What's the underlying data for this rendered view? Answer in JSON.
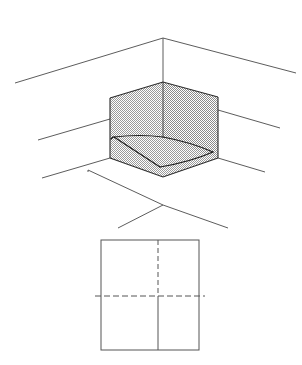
{
  "figure": {
    "background_color": "#ffffff",
    "line_color": "#4a4a4a",
    "edge_color": "#2b2b2b",
    "fill_pattern": "stipple-gray",
    "fill_color": "#bfbfbf"
  },
  "perspective_view": {
    "name": "isometric-corner-volume",
    "apex_point": {
      "x": 163,
      "y": 38
    },
    "ceiling_lines": [
      {
        "name": "ceiling-edge-left",
        "x1": 15,
        "y1": 83,
        "x2": 163,
        "y2": 38
      },
      {
        "name": "ceiling-edge-right",
        "x1": 163,
        "y1": 38,
        "x2": 296,
        "y2": 73
      }
    ],
    "vertical_corner_line": {
      "x1": 163,
      "y1": 38,
      "x2": 163,
      "y2": 138
    },
    "mid_lines": [
      {
        "name": "wall-line-left",
        "x1": 38,
        "y1": 140,
        "x2": 110,
        "y2": 119
      },
      {
        "name": "wall-line-right",
        "x1": 218,
        "y1": 110,
        "x2": 280,
        "y2": 128
      }
    ],
    "lower_lines": [
      {
        "name": "floor-line-left",
        "x1": 42,
        "y1": 178,
        "x2": 110,
        "y2": 158
      },
      {
        "name": "floor-line-right",
        "x1": 218,
        "y1": 158,
        "x2": 265,
        "y2": 172
      }
    ],
    "cube": {
      "name": "shaded-corner-box",
      "top_left": {
        "x": 110,
        "y": 98
      },
      "top_apex": {
        "x": 163,
        "y": 82
      },
      "top_right": {
        "x": 218,
        "y": 97
      },
      "bottom_left": {
        "x": 110,
        "y": 158
      },
      "bottom_center": {
        "x": 163,
        "y": 174
      },
      "bottom_right": {
        "x": 218,
        "y": 158
      },
      "inner_vertical": {
        "x": 163,
        "y_top": 82,
        "y_bottom": 138
      }
    },
    "floor_plane": {
      "name": "interior-floor-quad",
      "left": {
        "x": 114,
        "y": 138
      },
      "back": {
        "x": 163,
        "y": 138
      },
      "right": {
        "x": 212,
        "y": 152
      },
      "front": {
        "x": 160,
        "y": 168
      }
    },
    "projection_lines": [
      {
        "name": "projection-left-leg",
        "x1": 88,
        "y1": 170,
        "x2": 163,
        "y2": 205
      },
      {
        "name": "projection-right-leg",
        "x1": 163,
        "y1": 205,
        "x2": 228,
        "y2": 228
      },
      {
        "name": "projection-down-left",
        "x1": 163,
        "y1": 205,
        "x2": 118,
        "y2": 228
      }
    ]
  },
  "plan_view": {
    "name": "plan-square",
    "left": 101,
    "top": 240,
    "right": 199,
    "bottom": 350,
    "width": 98,
    "height": 110,
    "center_x": 158,
    "center_y": 296,
    "vertical_centerline": {
      "name": "plan-vertical-centerline",
      "style": "solid-lower-dashed-upper",
      "x": 158,
      "y_top": 240,
      "y_bottom": 350,
      "dash_split_y": 296
    },
    "horizontal_centerline": {
      "name": "plan-horizontal-centerline",
      "style": "dashed",
      "y": 296,
      "x_left": 95,
      "x_right": 205
    }
  },
  "labels": {
    "visible_text": []
  }
}
